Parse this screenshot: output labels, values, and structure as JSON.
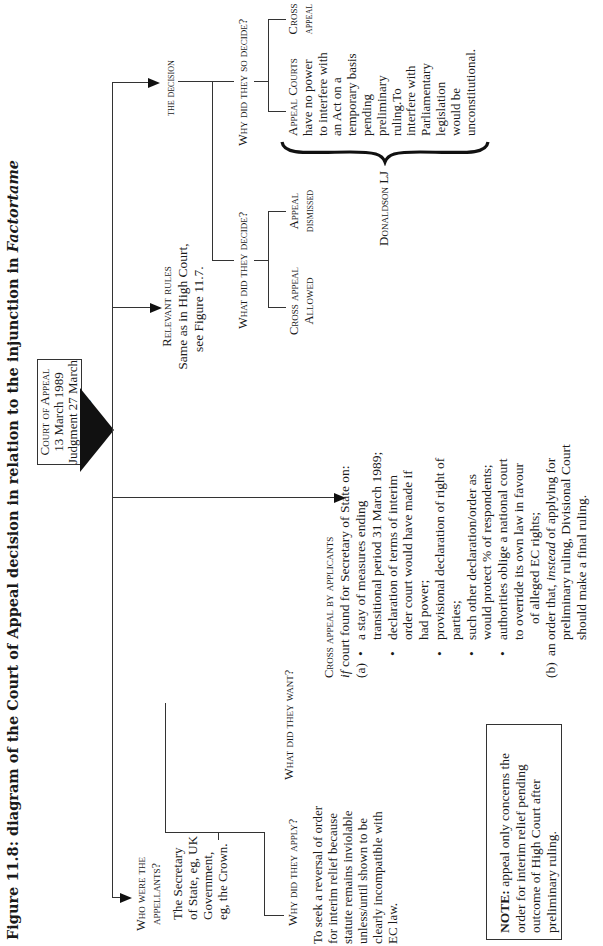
{
  "title": {
    "prefix": "Figure 11.8: diagram of the Court of Appeal decision in relation to the injunction in ",
    "italic": "Factortame"
  },
  "court_box": {
    "heading": "Court of Appeal",
    "date1": "13 March 1989",
    "date2": "Judgment 27 March 1989"
  },
  "appellants": {
    "heading_line1": "Who were the",
    "heading_line2": "appellants?",
    "body": [
      "The Secretary",
      "of State, eg, UK",
      "Government,",
      "eg, the Crown."
    ]
  },
  "why_apply": {
    "heading": "Why did they apply?",
    "body": [
      "To seek a reversal of order",
      "for interim relief because",
      "statute remains inviolable",
      "unless/until shown to be",
      "clearly incompatible with",
      "EC law."
    ]
  },
  "what_want": {
    "heading": "What did they want?"
  },
  "cross_appeal": {
    "heading": "Cross appeal by applicants",
    "intro_italic": "if",
    "intro_rest": " court found for Secretary of State on:",
    "a_label": "(a)",
    "a_items": [
      [
        "a stay of measures ending",
        "transitional period 31 March 1989;"
      ],
      [
        "declaration of terms of interim",
        "order court would have made if",
        "had power;"
      ],
      [
        "provisional declaration of right of",
        "parties;"
      ],
      [
        "such other declaration/order as",
        "would protect % of respondents;"
      ],
      [
        "authorities oblige a national court",
        "to override its own law in favour",
        "of alleged EC rights;"
      ]
    ],
    "b_label": "(b)",
    "b_pre": "an order that, ",
    "b_italic": "instead",
    "b_post": " of applying for",
    "b_lines": [
      "preliminary ruling, Divisional Court",
      "should make a final ruling."
    ]
  },
  "relevant_rules": {
    "heading": "Relevant rules",
    "body": [
      "Same as in High Court,",
      "see Figure 11.7."
    ]
  },
  "decision": {
    "heading": "the decision",
    "what_decide": "What did they decide?",
    "why_decide": "Why did they so decide?",
    "outcomes": [
      {
        "line1": "Cross appeal",
        "line2": "Allowed"
      },
      {
        "line1": "Appeal",
        "line2": "dismissed"
      }
    ],
    "reasons": {
      "appeal_courts": [
        "Appeal Courts",
        "have no power",
        "to interfere with",
        "an Act on a",
        "temporary basis",
        "pending",
        "preliminary",
        "ruling.To",
        "interfere with",
        "Parliamentary",
        "legislation",
        "would be",
        "unconstitutional."
      ],
      "cross_appeal": [
        "Cross",
        "appeal"
      ]
    },
    "judge": "Donaldson LJ"
  },
  "note": {
    "bold": "NOTE:",
    "lines": [
      " appeal only concerns the",
      "order for interim relief pending",
      "outcome of High Court after",
      "preliminary ruling."
    ]
  }
}
